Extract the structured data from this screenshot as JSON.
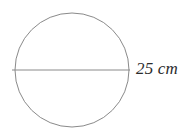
{
  "figure": {
    "background_color": "#ffffff",
    "stroke_color": "#8a8a8a",
    "text_color": "#2b2b2b",
    "label": {
      "text": "25 cm",
      "value": "25",
      "unit": "cm",
      "style": "italic",
      "refers_to": "diameter"
    },
    "shapes": {
      "circle": {
        "name": "circle-outline",
        "cx": 72,
        "cy": 70,
        "r": 57,
        "stroke_width": 1
      },
      "diameter": {
        "name": "diameter-line",
        "x1": 12,
        "y1": 70,
        "x2": 130,
        "y2": 70,
        "stroke_width": 1
      }
    }
  }
}
